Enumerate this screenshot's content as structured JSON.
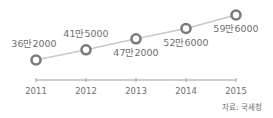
{
  "chart_data": {
    "type": "line",
    "title": "",
    "xlabel": "",
    "ylabel": "",
    "categories": [
      "2011",
      "2012",
      "2013",
      "2014",
      "2015"
    ],
    "series": [
      {
        "name": "",
        "values": [
          362000,
          415000,
          472000,
          526000,
          596000
        ],
        "labels": [
          "36만2000",
          "41만5000",
          "47만2000",
          "52만6000",
          "59만6000"
        ]
      }
    ],
    "ylim": [
      300000,
      650000
    ],
    "grid": false,
    "legend": "none",
    "source": "자료: 국세청"
  },
  "colors": {
    "line": "#c8c8c8",
    "marker": "#7a7a7a",
    "text": "#6e6e6e",
    "axis": "#888888"
  }
}
